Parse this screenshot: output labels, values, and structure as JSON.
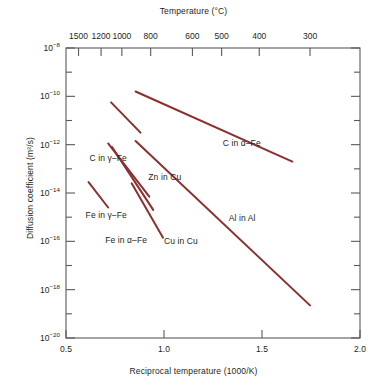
{
  "chart_data": {
    "type": "line",
    "title": "",
    "xlabel": "Reciprocal temperature (1000/K)",
    "ylabel": "Diffusion coefficient (m2/s)",
    "ylabel_display": "Diffusion coefficient (m²/s)",
    "top_axis_label": "Temperature (°C)",
    "xlim": [
      0.5,
      2.0
    ],
    "ylim_exponent": [
      -20,
      -8
    ],
    "yscale": "log",
    "grid": false,
    "legend": "inline-labels",
    "x_ticks": [
      "0.5",
      "1.0",
      "1.5",
      "2.0"
    ],
    "x_tick_values": [
      0.5,
      1.0,
      1.5,
      2.0
    ],
    "y_ticks": [
      "10-8",
      "10-10",
      "10-12",
      "10-14",
      "10-16",
      "10-18",
      "10-20"
    ],
    "y_tick_exponents": [
      -8,
      -10,
      -12,
      -14,
      -16,
      -18,
      -20
    ],
    "y_minor_exponents": [
      -9,
      -11,
      -13,
      -15,
      -17,
      -19
    ],
    "top_ticks": [
      "1500",
      "1200",
      "1000",
      "800",
      "600",
      "500",
      "400",
      "300"
    ],
    "top_tick_celsius": [
      1500,
      1200,
      1000,
      800,
      600,
      500,
      400,
      300
    ],
    "top_tick_x_values": [
      0.564,
      0.679,
      0.785,
      0.932,
      1.145,
      1.294,
      1.486,
      1.745
    ],
    "series": [
      {
        "name": "C in γ-Fe",
        "label": "C in γ–Fe",
        "label_x": 0.62,
        "label_y_exponent": -12.55,
        "x": [
          0.73,
          0.88
        ],
        "y_exponent": [
          -10.25,
          -11.5
        ]
      },
      {
        "name": "C in α-Fe",
        "label": "C in α–Fe",
        "label_x": 1.3,
        "label_y_exponent": -11.95,
        "x": [
          0.855,
          1.655
        ],
        "y_exponent": [
          -9.8,
          -12.7
        ]
      },
      {
        "name": "Zn in Cu",
        "label": "Zn in Cu",
        "label_x": 0.92,
        "label_y_exponent": -13.35,
        "x": [
          0.715,
          0.925
        ],
        "y_exponent": [
          -11.95,
          -14.15
        ]
      },
      {
        "name": "Fe in γ-Fe",
        "label": "Fe in γ–Fe",
        "label_x": 0.6,
        "label_y_exponent": -14.9,
        "x": [
          0.615,
          0.715
        ],
        "y_exponent": [
          -13.55,
          -14.6
        ]
      },
      {
        "name": "Fe in α-Fe",
        "label": "Fe in α–Fe",
        "label_x": 0.7,
        "label_y_exponent": -15.95,
        "x": [
          0.735,
          0.945
        ],
        "y_exponent": [
          -12.1,
          -14.7
        ]
      },
      {
        "name": "Cu in Cu",
        "label": "Cu in Cu",
        "label_x": 1.0,
        "label_y_exponent": -16.0,
        "x": [
          0.835,
          0.995
        ],
        "y_exponent": [
          -13.6,
          -15.85
        ]
      },
      {
        "name": "Al in Al",
        "label": "Al in Al",
        "label_x": 1.33,
        "label_y_exponent": -15.05,
        "x": [
          0.855,
          1.745
        ],
        "y_exponent": [
          -11.85,
          -18.65
        ]
      }
    ],
    "line_color": "#8c2f2f",
    "axis_color": "#58595b"
  },
  "figure": {
    "top_axis_title": "Temperature (°C)",
    "bottom_axis_title": "Reciprocal temperature (1000/K)",
    "left_axis_title": "Diffusion coefficient (m²/s)"
  }
}
